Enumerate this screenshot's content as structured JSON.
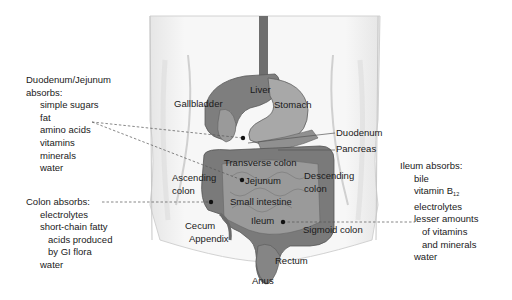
{
  "diagram": {
    "type": "anatomical-illustration",
    "colors": {
      "organ_fill": "#8a8a8a",
      "organ_dark": "#5e5e5e",
      "body_outline": "#c8c8c8",
      "body_fill": "#f4f4f4",
      "text": "#1a1a1a",
      "leader_line": "#555555"
    },
    "organ_labels": {
      "liver": "Liver",
      "gallbladder": "Gallbladder",
      "stomach": "Stomach",
      "duodenum": "Duodenum",
      "pancreas": "Pancreas",
      "transverse_colon": "Transverse colon",
      "ascending_colon_1": "Ascending",
      "ascending_colon_2": "colon",
      "jejunum": "Jejunum",
      "descending_colon_1": "Descending",
      "descending_colon_2": "colon",
      "small_intestine": "Small intestine",
      "ileum": "Ileum",
      "cecum": "Cecum",
      "appendix": "Appendix",
      "sigmoid_colon": "Sigmoid colon",
      "rectum": "Rectum",
      "anus": "Anus"
    },
    "duodenum_jejunum": {
      "title_1": "Duodenum/Jejunum",
      "title_2": "absorbs:",
      "items": [
        "simple sugars",
        "fat",
        "amino acids",
        "vitamins",
        "minerals",
        "water"
      ]
    },
    "colon": {
      "title": "Colon absorbs:",
      "items": [
        "electrolytes",
        "short-chain fatty",
        "acids produced",
        "by GI flora",
        "water"
      ]
    },
    "ileum": {
      "title": "Ileum absorbs:",
      "items": [
        "bile",
        "vitamin B",
        "electrolytes",
        "lesser amounts",
        "of vitamins",
        "and minerals",
        "water"
      ],
      "vitamin_subscript": "12"
    }
  }
}
